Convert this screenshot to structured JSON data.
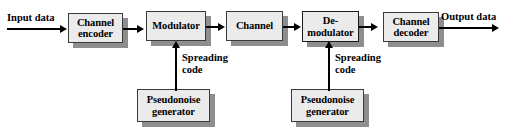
{
  "diagram": {
    "type": "block-diagram",
    "colors": {
      "box_fill": "#ebebeb",
      "box_border": "#3a3a3a",
      "shadow": "#8e8e8e",
      "line": "#000000",
      "background": "#ffffff"
    },
    "io_labels": {
      "input": "Input data",
      "output": "Output data"
    },
    "blocks": [
      {
        "id": "channel-encoder",
        "label": "Channel\nencoder"
      },
      {
        "id": "modulator",
        "label": "Modulator"
      },
      {
        "id": "channel",
        "label": "Channel"
      },
      {
        "id": "demodulator",
        "label": "De-\nmodulator"
      },
      {
        "id": "channel-decoder",
        "label": "Channel\ndecoder"
      },
      {
        "id": "pn-generator-tx",
        "label": "Pseudonoise\ngenerator"
      },
      {
        "id": "pn-generator-rx",
        "label": "Pseudonoise\ngenerator"
      }
    ],
    "connector_labels": [
      {
        "id": "spreading-code-tx",
        "label": "Spreading\ncode"
      },
      {
        "id": "spreading-code-rx",
        "label": "Spreading\ncode"
      }
    ]
  }
}
